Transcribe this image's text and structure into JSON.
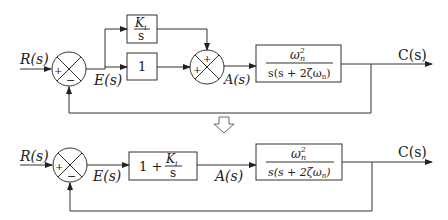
{
  "top": {
    "input_label": "R(s)",
    "error_label": "E(s)",
    "a_label": "A(s)",
    "output_label": "C(s)",
    "sum1_signs": {
      "left": "+",
      "bottom": "−"
    },
    "sum2_signs": {
      "top": "+",
      "left": "+"
    },
    "integral_block": {
      "num": "K",
      "num_sub": "i",
      "den": "s"
    },
    "proportional_block": "1",
    "plant_block": {
      "num": "ω",
      "num_sup": "2",
      "num_sub": "n",
      "den": "s(s + 2ζω",
      "den_sub": "n",
      "den_close": ")"
    }
  },
  "arrow": {
    "icon": "down-arrow-icon"
  },
  "bottom": {
    "input_label": "R(s)",
    "error_label": "E(s)",
    "a_label": "A(s)",
    "output_label": "C(s)",
    "sum_signs": {
      "left": "+",
      "bottom": "−"
    },
    "pi_block": {
      "prefix": "1 + ",
      "num": "K",
      "num_sub": "i",
      "den": "s"
    },
    "plant_block": {
      "num": "ω",
      "num_sup": "2",
      "num_sub": "n",
      "den": "s(s + 2ζω",
      "den_sub": "n",
      "den_close": ")"
    }
  }
}
